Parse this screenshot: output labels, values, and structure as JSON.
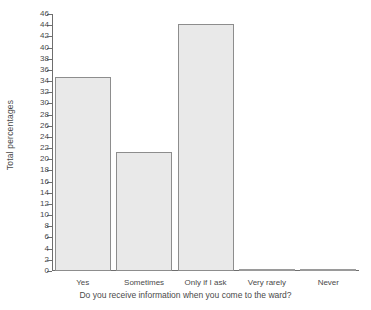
{
  "chart_data": {
    "type": "bar",
    "title": "",
    "categories": [
      "Yes",
      "Sometimes",
      "Only if I ask",
      "Very rarely",
      "Never"
    ],
    "values": [
      34.7,
      21.3,
      44.3,
      0.2,
      0.2
    ],
    "xlabel": "Do you receive information when you come to the ward?",
    "ylabel": "Total  percentages",
    "ylim": [
      0,
      46
    ],
    "ytick_step": 2,
    "yticks": [
      0,
      2,
      4,
      6,
      8,
      10,
      12,
      14,
      16,
      18,
      20,
      22,
      24,
      26,
      28,
      30,
      32,
      34,
      36,
      38,
      40,
      42,
      44,
      46
    ],
    "ytick_labels": [
      "0",
      "2",
      "4",
      "6",
      "8",
      "10",
      "12",
      "14",
      "16",
      "18",
      "20",
      "22",
      "24",
      "26",
      "28",
      "30",
      "32",
      "34",
      "36",
      "38",
      "40",
      "42",
      "44",
      "46"
    ],
    "grid": false,
    "legend": null,
    "legend_position": "none",
    "bar_fill_color": "#e9e9e9",
    "bar_edge_color": "#8d8d8d",
    "axis_color": "#6e6e6e",
    "background_color": "#ffffff",
    "text_color": "#4a4a4a"
  }
}
